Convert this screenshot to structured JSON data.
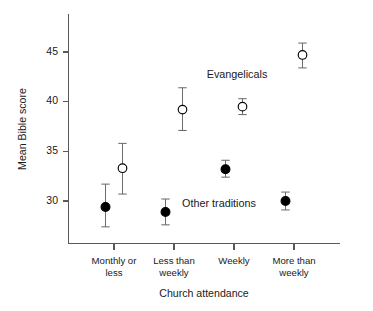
{
  "chart_data": {
    "type": "scatter",
    "title": "",
    "xlabel": "Church attendance",
    "ylabel": "Mean Bible score",
    "categories": [
      "Monthly or less",
      "Less than weekly",
      "Weekly",
      "More than weekly"
    ],
    "category_lines": [
      [
        "Monthly or",
        "less"
      ],
      [
        "Less than",
        "weekly"
      ],
      [
        "Weekly",
        ""
      ],
      [
        "More than",
        "weekly"
      ]
    ],
    "ylim": [
      26.5,
      47.5
    ],
    "yticks": [
      30,
      35,
      40,
      45
    ],
    "ytick_labels": [
      "30",
      "35",
      "40",
      "45"
    ],
    "grid": false,
    "legend_position": "inline-annotation",
    "series": [
      {
        "name": "Evangelicals",
        "marker": "open-circle",
        "values": [
          33.3,
          39.2,
          39.5,
          44.7
        ],
        "err_low": [
          30.7,
          37.1,
          38.7,
          43.4
        ],
        "err_high": [
          35.8,
          41.4,
          40.3,
          45.9
        ],
        "annotation": "Evangelicals",
        "annotation_x": 2.05,
        "annotation_y": 42.4
      },
      {
        "name": "Other traditions",
        "marker": "filled-circle",
        "values": [
          29.4,
          28.9,
          33.2,
          30.0
        ],
        "err_low": [
          27.4,
          27.6,
          32.4,
          29.1
        ],
        "err_high": [
          31.7,
          30.2,
          34.1,
          30.9
        ],
        "annotation": "Other traditions",
        "annotation_x": 1.75,
        "annotation_y": 29.4
      }
    ]
  },
  "axis": {
    "y_title": "Mean Bible score",
    "x_title": "Church attendance"
  },
  "colors": {
    "axis": "#58595b",
    "errorbar": "#6b6c6e",
    "marker_fill_open": "#ffffff",
    "marker_fill_closed": "#000000",
    "text": "#1a1a1a",
    "background": "#ffffff"
  }
}
